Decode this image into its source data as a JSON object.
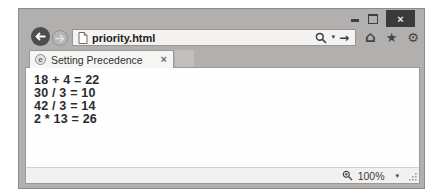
{
  "colors": {
    "chrome": "#b1b0af",
    "close_button_bg": "#3a3a3a",
    "tab_bg": "#f6f6f5",
    "content_bg": "#fefefe",
    "statusbar_bg": "#f2f1ef",
    "text": "#2c2c2c"
  },
  "window_controls": {
    "close_glyph": "×"
  },
  "toolbar": {
    "address_bar": {
      "url": "priority.html",
      "dropdown_glyph": "▾",
      "go_glyph": "→"
    },
    "home_glyph": "⌂",
    "favorites_glyph": "★",
    "tools_glyph": "⚙"
  },
  "tab": {
    "favicon_glyph": "e",
    "title": "Setting Precedence",
    "close_glyph": "×"
  },
  "page": {
    "lines": [
      "18 + 4 = 22",
      "30 / 3 = 10",
      "42 / 3 = 14",
      "2 * 13 = 26"
    ]
  },
  "statusbar": {
    "zoom_level": "100%",
    "dropdown_glyph": "▾"
  }
}
